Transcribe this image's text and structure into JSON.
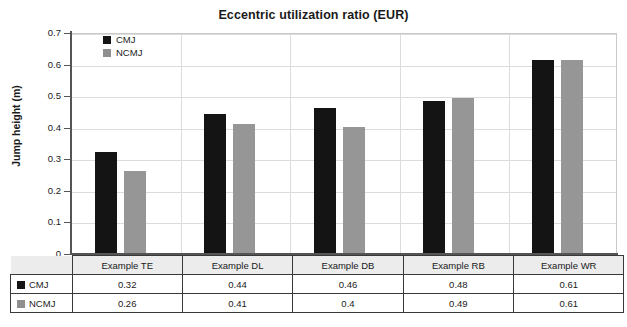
{
  "chart_data": {
    "type": "bar",
    "title": "Eccentric utilization ratio (EUR)",
    "xlabel": "",
    "ylabel": "Jump height (m)",
    "ylim": [
      0,
      0.7
    ],
    "ytick_labels": [
      "0.7",
      "0.6",
      "0.5",
      "0.4",
      "0.3",
      "0.2",
      "0.1",
      "0"
    ],
    "ytick_values": [
      0.7,
      0.6,
      0.5,
      0.4,
      0.3,
      0.2,
      0.1,
      0
    ],
    "grid": "horizontal-and-vertical",
    "legend_position": "top-left-inside",
    "categories": [
      "Example TE",
      "Example DL",
      "Example DB",
      "Example RB",
      "Example WR"
    ],
    "series": [
      {
        "name": "CMJ",
        "color": "#141414",
        "values": [
          0.32,
          0.44,
          0.46,
          0.48,
          0.61
        ],
        "labels": [
          "0.32",
          "0.44",
          "0.46",
          "0.48",
          "0.61"
        ]
      },
      {
        "name": "NCMJ",
        "color": "#969696",
        "values": [
          0.26,
          0.41,
          0.4,
          0.49,
          0.61
        ],
        "labels": [
          "0.26",
          "0.41",
          "0.4",
          "0.49",
          "0.61"
        ]
      }
    ]
  },
  "legend": {
    "items": [
      {
        "label": "CMJ",
        "swatch": "black-square-swatch"
      },
      {
        "label": "NCMJ",
        "swatch": "gray-square-swatch"
      }
    ]
  },
  "table": {
    "header": [
      "",
      "Example TE",
      "Example DL",
      "Example DB",
      "Example RB",
      "Example WR"
    ],
    "rows": [
      {
        "label": "CMJ",
        "cells": [
          "0.32",
          "0.44",
          "0.46",
          "0.48",
          "0.61"
        ]
      },
      {
        "label": "NCMJ",
        "cells": [
          "0.26",
          "0.41",
          "0.4",
          "0.49",
          "0.61"
        ]
      }
    ]
  },
  "colors": {
    "cmj": "#141414",
    "ncmj": "#969696",
    "grid": "#dcdcdc",
    "axis": "#555555",
    "table_border": "#3a3a3a",
    "header_fill": "#ececec"
  }
}
